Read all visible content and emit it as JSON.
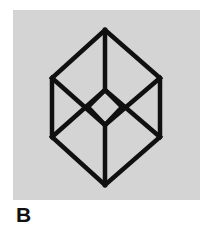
{
  "figure": {
    "caption": "B",
    "caption_color": "#111111",
    "plate_color": "#d4d4d4",
    "page_background": "#ffffff",
    "stroke_color": "#101010",
    "stroke_width": 4.5,
    "plate": {
      "x": 13,
      "y": 10,
      "width": 187,
      "height": 190
    },
    "geometry": {
      "hexagon_label": "outer-hexagon",
      "hexagon_points": "105,30 160,78 160,137 105,185 52,137 52,78",
      "inner_diamond_label": "inner-diamond",
      "inner_diamond_points": "105,90 122,107 105,125 88,107",
      "spokes": [
        {
          "name": "spoke-top",
          "x1": 105,
          "y1": 30,
          "x2": 105,
          "y2": 90
        },
        {
          "name": "spoke-bottom",
          "x1": 105,
          "y1": 125,
          "x2": 105,
          "y2": 185
        },
        {
          "name": "spoke-upper-left",
          "x1": 52,
          "y1": 78,
          "x2": 105,
          "y2": 125
        },
        {
          "name": "spoke-upper-right",
          "x1": 160,
          "y1": 78,
          "x2": 105,
          "y2": 125
        },
        {
          "name": "spoke-lower-left",
          "x1": 52,
          "y1": 137,
          "x2": 105,
          "y2": 90
        },
        {
          "name": "spoke-lower-right",
          "x1": 160,
          "y1": 137,
          "x2": 105,
          "y2": 90
        }
      ]
    }
  }
}
